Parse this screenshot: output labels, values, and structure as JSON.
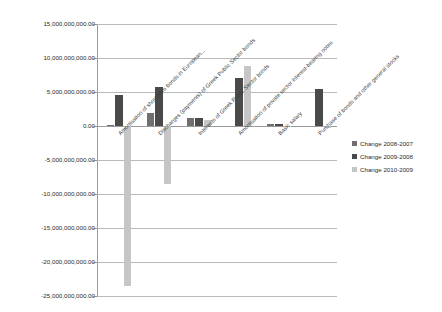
{
  "chart_data": {
    "type": "bar",
    "title": "",
    "xlabel": "",
    "ylabel": "",
    "ylim": [
      -25000000000,
      15000000000
    ],
    "grid": true,
    "legend_position": "right",
    "ytick_labels": [
      "15,000,000,000.00",
      "10,000,000,000.00",
      "5,000,000,000.00",
      "0.00",
      "-5,000,000,000.00",
      "-10,000,000,000.00",
      "-15,000,000,000.00",
      "-20,000,000,000.00",
      "-25,000,000,000.00"
    ],
    "ytick_values": [
      15000000000,
      10000000000,
      5000000000,
      0,
      -5000000000,
      -10000000000,
      -15000000000,
      -20000000000,
      -25000000000
    ],
    "categories": [
      "Amortisation of short-term bonds in European...",
      "Discharges (payments) of Greek Public Sector bonds",
      "Interests of Greek Public Sector bonds",
      "Amortisation of private sector interest-bearing notes",
      "Basic salary",
      "Purchase of bonds and other general stocks"
    ],
    "series": [
      {
        "name": "Change 2008-2007",
        "color": "#6f6f6f",
        "values": [
          100000000,
          1900000000,
          1200000000,
          0,
          300000000,
          0
        ]
      },
      {
        "name": "Change 2009-2008",
        "color": "#4a4a4a",
        "values": [
          4500000000,
          5800000000,
          1200000000,
          7000000000,
          300000000,
          5500000000
        ]
      },
      {
        "name": "Change 2010-2009",
        "color": "#c6c6c6",
        "values": [
          -23500000000,
          -8500000000,
          900000000,
          8800000000,
          -200000000,
          -300000000
        ]
      }
    ]
  },
  "legend": {
    "items": [
      {
        "label": "Change 2008-2007"
      },
      {
        "label": "Change 2009-2008"
      },
      {
        "label": "Change 2010-2009"
      }
    ]
  }
}
